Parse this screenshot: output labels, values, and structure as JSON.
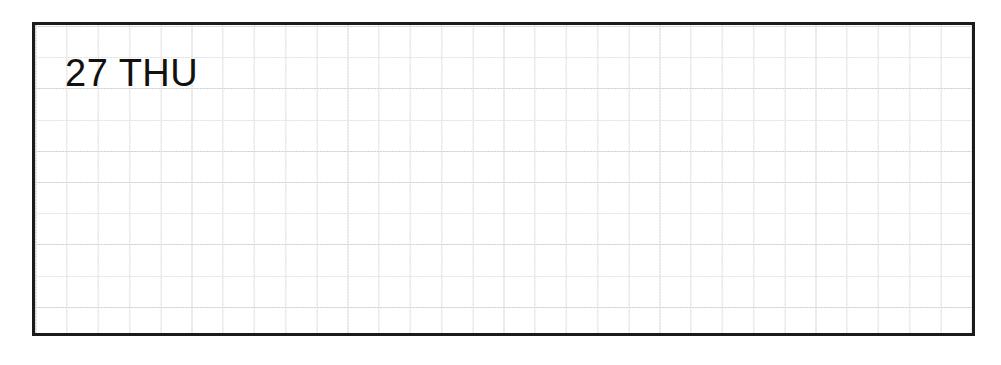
{
  "page": {
    "background_color": "#ffffff",
    "width": 1001,
    "height": 365
  },
  "day_box": {
    "border_color": "#1b1b1b",
    "background_color": "#ffffff",
    "grid": {
      "line_color": "#d2d2d2",
      "cell_size_px": 31,
      "columns": 30,
      "rows": 10,
      "style": "graph-paper"
    }
  },
  "heading": {
    "full_label": "27 THU",
    "day_number": "27",
    "weekday": "THU",
    "text_color": "#111111"
  },
  "notes": {
    "entries": []
  }
}
